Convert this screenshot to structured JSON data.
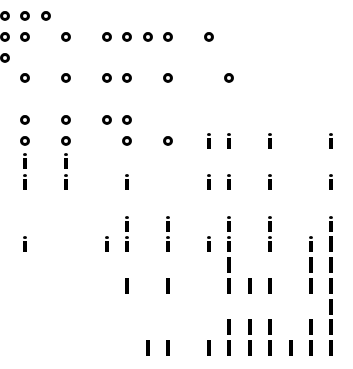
{
  "grid": {
    "origin_x": 5,
    "origin_y": 16,
    "col_pitch": 20.4,
    "row_pitch": 20.75,
    "ink_color": "#000000",
    "background_color": "#ffffff"
  },
  "glyph_types": {
    "o": "ring-glyph",
    "i": "i-glyph",
    "l": "bar-glyph"
  },
  "rows": [
    {
      "row": 0,
      "cells": [
        {
          "col": 0,
          "g": "o"
        },
        {
          "col": 1,
          "g": "o"
        },
        {
          "col": 2,
          "g": "o"
        }
      ]
    },
    {
      "row": 1,
      "cells": [
        {
          "col": 0,
          "g": "o"
        },
        {
          "col": 1,
          "g": "o"
        },
        {
          "col": 3,
          "g": "o"
        },
        {
          "col": 5,
          "g": "o"
        },
        {
          "col": 6,
          "g": "o"
        },
        {
          "col": 7,
          "g": "o"
        },
        {
          "col": 8,
          "g": "o"
        },
        {
          "col": 10,
          "g": "o"
        }
      ]
    },
    {
      "row": 2,
      "cells": [
        {
          "col": 0,
          "g": "o"
        }
      ]
    },
    {
      "row": 3,
      "cells": [
        {
          "col": 1,
          "g": "o"
        },
        {
          "col": 3,
          "g": "o"
        },
        {
          "col": 5,
          "g": "o"
        },
        {
          "col": 6,
          "g": "o"
        },
        {
          "col": 8,
          "g": "o"
        },
        {
          "col": 11,
          "g": "o"
        }
      ]
    },
    {
      "row": 5,
      "cells": [
        {
          "col": 1,
          "g": "o"
        },
        {
          "col": 3,
          "g": "o"
        },
        {
          "col": 5,
          "g": "o"
        },
        {
          "col": 6,
          "g": "o"
        }
      ]
    },
    {
      "row": 6,
      "cells": [
        {
          "col": 1,
          "g": "o"
        },
        {
          "col": 3,
          "g": "o"
        },
        {
          "col": 6,
          "g": "o"
        },
        {
          "col": 8,
          "g": "o"
        },
        {
          "col": 10,
          "g": "i"
        },
        {
          "col": 11,
          "g": "i"
        },
        {
          "col": 13,
          "g": "i"
        },
        {
          "col": 16,
          "g": "i"
        }
      ]
    },
    {
      "row": 7,
      "cells": [
        {
          "col": 1,
          "g": "i"
        },
        {
          "col": 3,
          "g": "i"
        }
      ]
    },
    {
      "row": 8,
      "cells": [
        {
          "col": 1,
          "g": "i"
        },
        {
          "col": 3,
          "g": "i"
        },
        {
          "col": 6,
          "g": "i"
        },
        {
          "col": 10,
          "g": "i"
        },
        {
          "col": 11,
          "g": "i"
        },
        {
          "col": 13,
          "g": "i"
        },
        {
          "col": 16,
          "g": "i"
        }
      ]
    },
    {
      "row": 10,
      "cells": [
        {
          "col": 6,
          "g": "i"
        },
        {
          "col": 8,
          "g": "i"
        },
        {
          "col": 11,
          "g": "i"
        },
        {
          "col": 13,
          "g": "i"
        },
        {
          "col": 16,
          "g": "i"
        }
      ]
    },
    {
      "row": 11,
      "cells": [
        {
          "col": 1,
          "g": "i"
        },
        {
          "col": 5,
          "g": "i"
        },
        {
          "col": 6,
          "g": "i"
        },
        {
          "col": 8,
          "g": "i"
        },
        {
          "col": 10,
          "g": "i"
        },
        {
          "col": 11,
          "g": "i"
        },
        {
          "col": 13,
          "g": "i"
        },
        {
          "col": 15,
          "g": "i"
        },
        {
          "col": 16,
          "g": "l"
        }
      ]
    },
    {
      "row": 12,
      "cells": [
        {
          "col": 11,
          "g": "l"
        },
        {
          "col": 15,
          "g": "l"
        },
        {
          "col": 16,
          "g": "l"
        }
      ]
    },
    {
      "row": 13,
      "cells": [
        {
          "col": 6,
          "g": "l"
        },
        {
          "col": 8,
          "g": "l"
        },
        {
          "col": 11,
          "g": "l"
        },
        {
          "col": 12,
          "g": "l"
        },
        {
          "col": 13,
          "g": "l"
        },
        {
          "col": 15,
          "g": "l"
        },
        {
          "col": 16,
          "g": "l"
        }
      ]
    },
    {
      "row": 14,
      "cells": [
        {
          "col": 16,
          "g": "l"
        }
      ]
    },
    {
      "row": 15,
      "cells": [
        {
          "col": 11,
          "g": "l"
        },
        {
          "col": 12,
          "g": "l"
        },
        {
          "col": 13,
          "g": "l"
        },
        {
          "col": 15,
          "g": "l"
        },
        {
          "col": 16,
          "g": "l"
        }
      ]
    },
    {
      "row": 16,
      "cells": [
        {
          "col": 7,
          "g": "l"
        },
        {
          "col": 8,
          "g": "l"
        },
        {
          "col": 10,
          "g": "l"
        },
        {
          "col": 11,
          "g": "l"
        },
        {
          "col": 12,
          "g": "l"
        },
        {
          "col": 13,
          "g": "l"
        },
        {
          "col": 14,
          "g": "l"
        },
        {
          "col": 15,
          "g": "l"
        },
        {
          "col": 16,
          "g": "l"
        }
      ]
    }
  ]
}
